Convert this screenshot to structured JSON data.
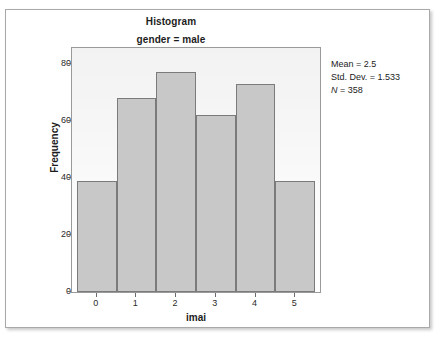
{
  "figure": {
    "caption_sliver": "",
    "title": "Histogram",
    "subtitle": "gender = male"
  },
  "stats": {
    "mean_label": "Mean = 2.5",
    "std_dev_label": "Std. Dev. = 1.533",
    "n_symbol": "N",
    "n_value": " = 358"
  },
  "colors": {
    "bar_fill": "#c8c8c8",
    "bar_border": "#7b7b7b",
    "panel_border": "#9a9a9a",
    "text": "#1c1c1c",
    "frame_border": "#a9a9a9"
  },
  "chart_data": {
    "type": "bar",
    "title": "Histogram",
    "subtitle": "gender = male",
    "xlabel": "imai",
    "ylabel": "Frequency",
    "categories": [
      "0",
      "1",
      "2",
      "3",
      "4",
      "5"
    ],
    "values": [
      39,
      68,
      77,
      62,
      73,
      39
    ],
    "xlim": [
      -0.62,
      5.62
    ],
    "ylim": [
      0,
      85.5
    ],
    "yticks": [
      0,
      20,
      40,
      60,
      80
    ],
    "xticks": [
      0,
      1,
      2,
      3,
      4,
      5
    ],
    "grid": false,
    "legend": null,
    "annotations": [
      "Mean = 2.5",
      "Std. Dev. = 1.533",
      "N = 358"
    ],
    "summary": {
      "mean": 2.5,
      "std_dev": 1.533,
      "n": 358
    }
  }
}
